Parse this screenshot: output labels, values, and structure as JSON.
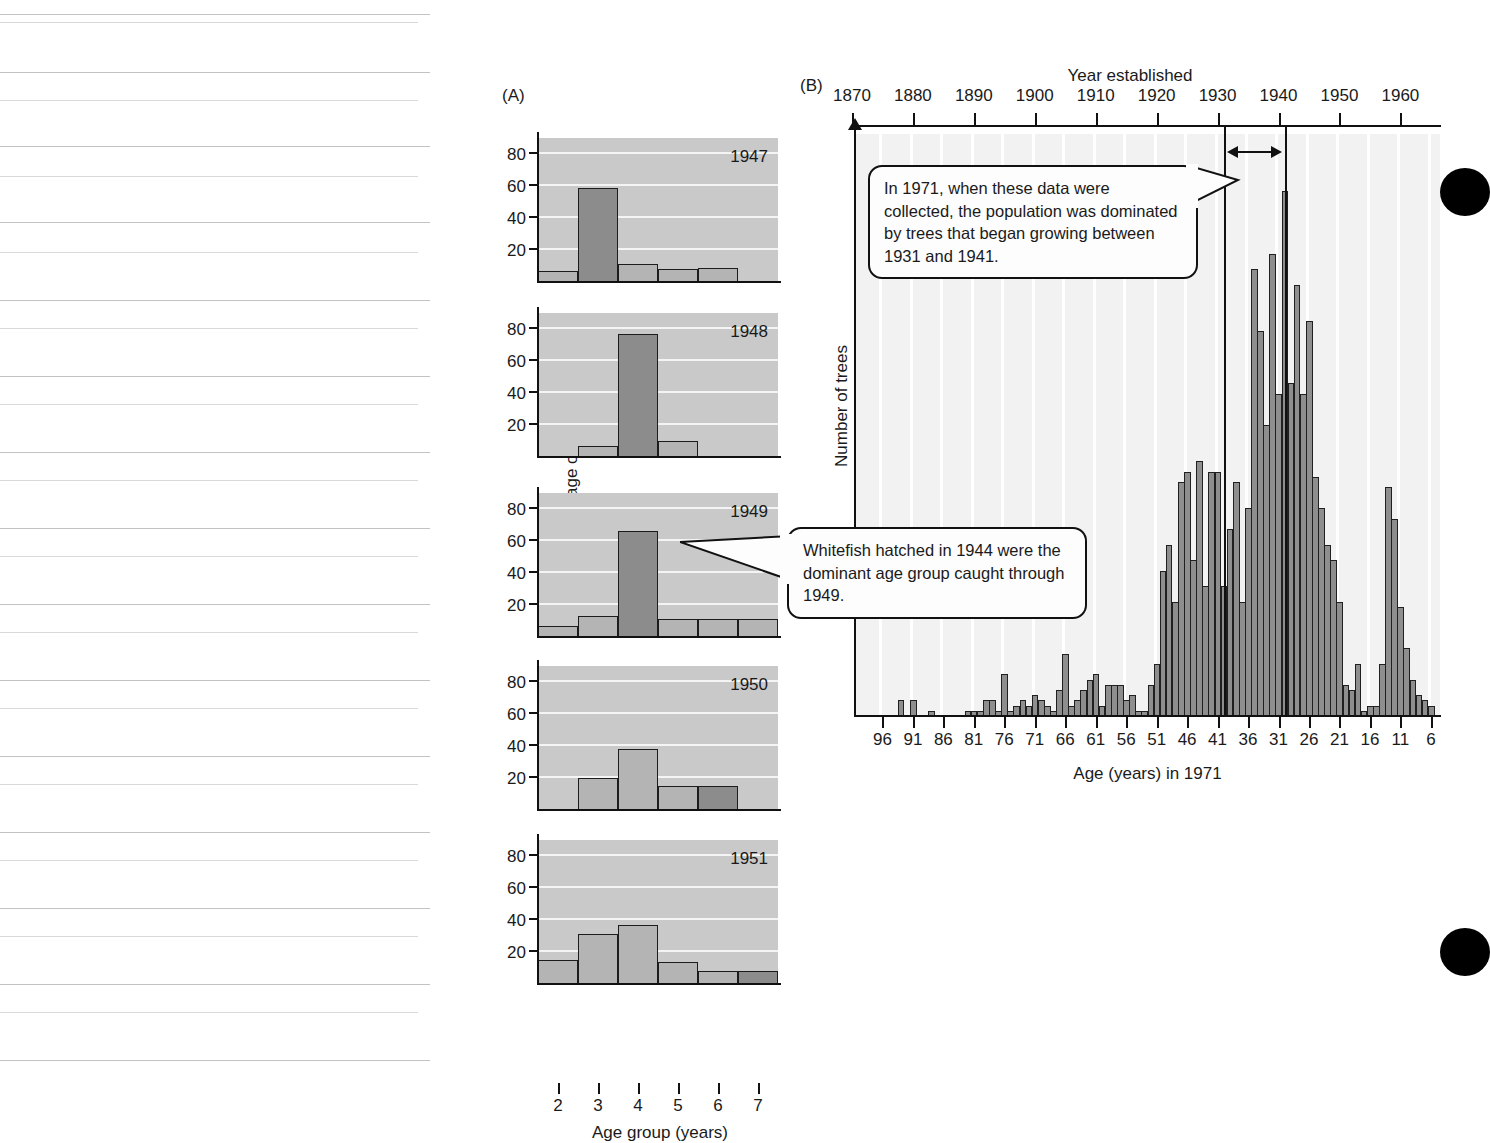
{
  "figure": {
    "panel_a_tag": "(A)",
    "panel_b_tag": "(B)"
  },
  "panel_a": {
    "ylabel": "Percentage of catch",
    "xlabel": "Age group (years)",
    "y_ticks": [
      "20",
      "40",
      "60",
      "80"
    ],
    "x_ticks": [
      "2",
      "3",
      "4",
      "5",
      "6",
      "7"
    ],
    "years": [
      "1947",
      "1948",
      "1949",
      "1950",
      "1951"
    ],
    "callout": "Whitefish hatched in 1944 were the dominant age group caught through 1949.",
    "colors": {
      "panel_background": "#c9c9c9",
      "gridline": "#f4f4f4",
      "bar_fill": "#b4b4b4",
      "bar_highlight_fill": "#8c8c8c",
      "bar_outline": "#1c1c1c"
    }
  },
  "panel_b": {
    "top_axis_label": "Year established",
    "ylabel": "Number of trees",
    "xlabel": "Age (years) in 1971",
    "top_ticks": [
      "1870",
      "1880",
      "1890",
      "1900",
      "1910",
      "1920",
      "1930",
      "1940",
      "1950",
      "1960"
    ],
    "bottom_ticks": [
      "96",
      "91",
      "86",
      "81",
      "76",
      "71",
      "66",
      "61",
      "56",
      "51",
      "46",
      "41",
      "36",
      "31",
      "26",
      "21",
      "16",
      "11",
      "6"
    ],
    "callout": "In 1971, when these data were collected, the population was dominated by trees that began growing between 1931 and 1941.",
    "marker_years": [
      "1931",
      "1941"
    ],
    "colors": {
      "panel_background": "#f2f2f2",
      "gridline": "#ffffff",
      "bar_fill": "#8e8e8e",
      "bar_outline": "#202020"
    }
  },
  "chart_data": [
    {
      "type": "bar",
      "title": "Percentage of catch by age group, 1947",
      "xlabel": "Age group (years)",
      "ylabel": "Percentage of catch",
      "categories": [
        "2",
        "3",
        "4",
        "5",
        "6",
        "7"
      ],
      "values": [
        7,
        59,
        11,
        8,
        9,
        0
      ],
      "highlight_index": 1,
      "ylim": [
        0,
        90
      ],
      "yticks": [
        20,
        40,
        60,
        80
      ],
      "grid": true,
      "legend": "none"
    },
    {
      "type": "bar",
      "title": "Percentage of catch by age group, 1948",
      "xlabel": "Age group (years)",
      "ylabel": "Percentage of catch",
      "categories": [
        "2",
        "3",
        "4",
        "5",
        "6",
        "7"
      ],
      "values": [
        0,
        7,
        77,
        10,
        0,
        0
      ],
      "highlight_index": 2,
      "ylim": [
        0,
        90
      ],
      "yticks": [
        20,
        40,
        60,
        80
      ],
      "grid": true,
      "legend": "none"
    },
    {
      "type": "bar",
      "title": "Percentage of catch by age group, 1949",
      "xlabel": "Age group (years)",
      "ylabel": "Percentage of catch",
      "categories": [
        "2",
        "3",
        "4",
        "5",
        "6",
        "7"
      ],
      "values": [
        7,
        13,
        66,
        11,
        11,
        11
      ],
      "highlight_index": 2,
      "ylim": [
        0,
        90
      ],
      "yticks": [
        20,
        40,
        60,
        80
      ],
      "grid": true,
      "legend": "none"
    },
    {
      "type": "bar",
      "title": "Percentage of catch by age group, 1950",
      "xlabel": "Age group (years)",
      "ylabel": "Percentage of catch",
      "categories": [
        "2",
        "3",
        "4",
        "5",
        "6",
        "7"
      ],
      "values": [
        0,
        20,
        38,
        15,
        15,
        0
      ],
      "highlight_index": 4,
      "ylim": [
        0,
        90
      ],
      "yticks": [
        20,
        40,
        60,
        80
      ],
      "grid": true,
      "legend": "none"
    },
    {
      "type": "bar",
      "title": "Percentage of catch by age group, 1951",
      "xlabel": "Age group (years)",
      "ylabel": "Percentage of catch",
      "categories": [
        "2",
        "3",
        "4",
        "5",
        "6",
        "7"
      ],
      "values": [
        15,
        31,
        37,
        14,
        8,
        8
      ],
      "highlight_index": 5,
      "ylim": [
        0,
        90
      ],
      "yticks": [
        20,
        40,
        60,
        80
      ],
      "grid": true,
      "legend": "none"
    },
    {
      "type": "bar",
      "title": "Tree age structure in 1971",
      "xlabel": "Age (years) in 1971",
      "ylabel": "Number of trees",
      "secondary_xlabel": "Year established",
      "x_ages": [
        100,
        99,
        98,
        97,
        96,
        95,
        94,
        93,
        92,
        91,
        90,
        89,
        88,
        87,
        86,
        85,
        84,
        83,
        82,
        81,
        80,
        79,
        78,
        77,
        76,
        75,
        74,
        73,
        72,
        71,
        70,
        69,
        68,
        67,
        66,
        65,
        64,
        63,
        62,
        61,
        60,
        59,
        58,
        57,
        56,
        55,
        54,
        53,
        52,
        51,
        50,
        49,
        48,
        47,
        46,
        45,
        44,
        43,
        42,
        41,
        40,
        39,
        38,
        37,
        36,
        35,
        34,
        33,
        32,
        31,
        30,
        29,
        28,
        27,
        26,
        25,
        24,
        23,
        22,
        21,
        20,
        19,
        18,
        17,
        16,
        15,
        14,
        13,
        12,
        11,
        10,
        9,
        8,
        7,
        6,
        5
      ],
      "values": [
        0,
        0,
        0,
        0,
        0,
        0,
        0,
        3,
        0,
        3,
        0,
        0,
        1,
        0,
        0,
        0,
        0,
        0,
        1,
        1,
        1,
        3,
        3,
        1,
        8,
        1,
        2,
        3,
        2,
        4,
        3,
        2,
        1,
        5,
        12,
        2,
        3,
        5,
        7,
        8,
        2,
        6,
        6,
        6,
        3,
        4,
        1,
        1,
        6,
        10,
        28,
        33,
        22,
        45,
        47,
        30,
        49,
        25,
        47,
        47,
        25,
        36,
        45,
        22,
        40,
        86,
        74,
        56,
        89,
        62,
        101,
        64,
        83,
        62,
        76,
        46,
        40,
        33,
        30,
        22,
        6,
        5,
        10,
        1,
        2,
        2,
        10,
        44,
        38,
        21,
        13,
        7,
        4,
        3,
        2,
        0
      ],
      "grid": true,
      "legend": "none",
      "annotation_range": {
        "from": 1931,
        "to": 1941
      }
    }
  ]
}
